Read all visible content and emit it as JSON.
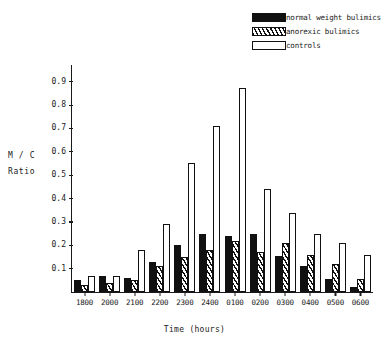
{
  "chart_data": {
    "type": "bar",
    "title": "",
    "xlabel": "Time (hours)",
    "ylabel_line1": "M / C",
    "ylabel_line2": "Ratio",
    "categories": [
      "1800",
      "2000",
      "2100",
      "2200",
      "2300",
      "2400",
      "0100",
      "0200",
      "0300",
      "0400",
      "0500",
      "0600"
    ],
    "series": [
      {
        "name": "normal weight bulimics",
        "fill": "solid-black",
        "values": [
          0.05,
          0.07,
          0.06,
          0.13,
          0.2,
          0.25,
          0.24,
          0.25,
          0.155,
          0.11,
          0.055,
          0.02
        ]
      },
      {
        "name": "anorexic bulimics",
        "fill": "hatched",
        "values": [
          0.03,
          0.04,
          0.05,
          0.11,
          0.15,
          0.18,
          0.22,
          0.17,
          0.21,
          0.16,
          0.12,
          0.055
        ]
      },
      {
        "name": "controls",
        "fill": "open-white",
        "values": [
          0.07,
          0.07,
          0.18,
          0.29,
          0.55,
          0.71,
          0.875,
          0.44,
          0.34,
          0.25,
          0.21,
          0.16
        ]
      }
    ],
    "ylim": [
      0,
      0.95
    ],
    "yticks": [
      0.1,
      0.2,
      0.3,
      0.4,
      0.5,
      0.6,
      0.7,
      0.8,
      0.9
    ],
    "ytick_labels": [
      "0.1",
      "0.2",
      "0.3",
      "0.4",
      "0.5",
      "0.6",
      "0.7",
      "0.8",
      "0.9"
    ],
    "grid": false,
    "legend_position": "top-right"
  },
  "legend": {
    "items": [
      {
        "label": "normal weight bulimics",
        "swatch": "solid-black"
      },
      {
        "label": "anorexic bulimics",
        "swatch": "hatched"
      },
      {
        "label": "controls",
        "swatch": "open-white"
      }
    ]
  }
}
